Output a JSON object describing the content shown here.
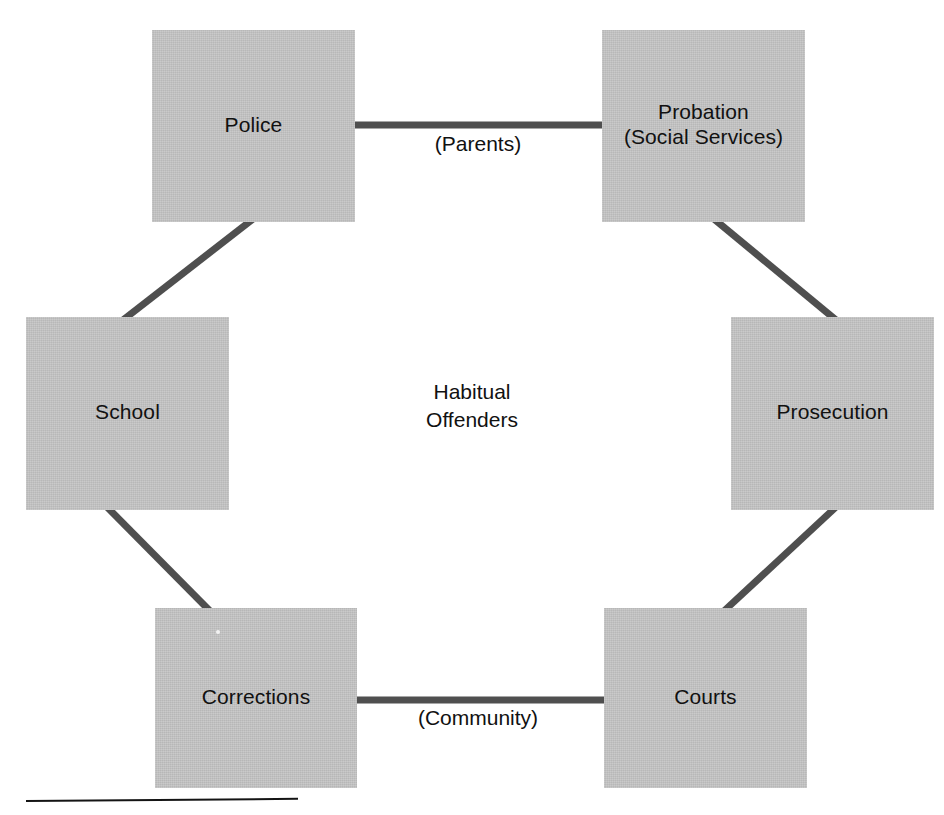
{
  "diagram": {
    "center_text": "Habitual\nOffenders",
    "box_fill_color": "#c4c4c4",
    "connector_color": "#4f4f4f",
    "text_color": "#111111",
    "rule_color": "#141414",
    "nodes": [
      {
        "id": "police",
        "label": "Police",
        "position": "top-left"
      },
      {
        "id": "probation",
        "label": "Probation\n(Social Services)",
        "position": "top-right"
      },
      {
        "id": "school",
        "label": "School",
        "position": "middle-left"
      },
      {
        "id": "prosecution",
        "label": "Prosecution",
        "position": "middle-right"
      },
      {
        "id": "corrections",
        "label": "Corrections",
        "position": "bottom-left"
      },
      {
        "id": "courts",
        "label": "Courts",
        "position": "bottom-right"
      }
    ],
    "edge_labels": [
      {
        "id": "parents",
        "label": "(Parents)",
        "between": "police-probation"
      },
      {
        "id": "community",
        "label": "(Community)",
        "between": "corrections-courts"
      }
    ],
    "connectors": [
      {
        "from": "police",
        "to": "probation",
        "kind": "horizontal"
      },
      {
        "from": "police",
        "to": "school",
        "kind": "diagonal"
      },
      {
        "from": "school",
        "to": "corrections",
        "kind": "diagonal"
      },
      {
        "from": "corrections",
        "to": "courts",
        "kind": "horizontal"
      },
      {
        "from": "courts",
        "to": "prosecution",
        "kind": "diagonal"
      },
      {
        "from": "prosecution",
        "to": "probation",
        "kind": "diagonal"
      }
    ]
  }
}
